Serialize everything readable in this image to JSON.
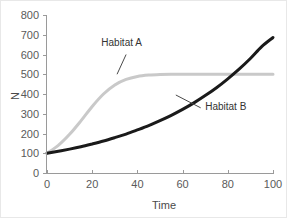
{
  "chart_data": {
    "type": "line",
    "title": "",
    "subtitle": "",
    "xlabel": "Time",
    "ylabel": "N",
    "xlim": [
      0,
      100
    ],
    "ylim": [
      0,
      800
    ],
    "xticks": [
      0,
      20,
      40,
      60,
      80,
      100
    ],
    "yticks": [
      0,
      100,
      200,
      300,
      400,
      500,
      600,
      700,
      800
    ],
    "xtick_labels": [
      "0",
      "20",
      "40",
      "60",
      "80",
      "100"
    ],
    "ytick_labels": [
      "0",
      "100",
      "200",
      "300",
      "400",
      "500",
      "600",
      "700",
      "800"
    ],
    "grid": false,
    "legend_position": "inline-annotations",
    "x": [
      0,
      5,
      10,
      15,
      20,
      25,
      30,
      35,
      40,
      45,
      50,
      55,
      60,
      65,
      70,
      75,
      80,
      85,
      90,
      95,
      100
    ],
    "series": [
      {
        "name": "Habitat A",
        "color": "#c9c9c9",
        "width": 3,
        "model": "logistic",
        "carrying_capacity": 500,
        "initial_N": 100,
        "values": [
          100,
          140,
          196,
          264,
          337,
          400,
          446,
          474,
          489,
          496,
          499,
          500,
          500,
          500,
          500,
          500,
          500,
          500,
          500,
          500,
          500
        ],
        "annotation": {
          "label": "Habitat A",
          "text_x": 33,
          "text_y": 645,
          "leader_from_x": 35,
          "leader_from_y": 600,
          "leader_to_x": 31,
          "leader_to_y": 500
        }
      },
      {
        "name": "Habitat B",
        "color": "#1a1a1a",
        "width": 3,
        "model": "exponential",
        "initial_N": 100,
        "values": [
          100,
          110,
          121,
          133,
          147,
          162,
          179,
          197,
          218,
          240,
          265,
          292,
          322,
          355,
          392,
          432,
          477,
          526,
          580,
          640,
          686
        ],
        "annotation": {
          "label": "Habitat B",
          "text_x": 70,
          "text_y": 320,
          "leader_from_x": 68,
          "leader_from_y": 330,
          "leader_to_x": 57,
          "leader_to_y": 395
        }
      }
    ]
  }
}
